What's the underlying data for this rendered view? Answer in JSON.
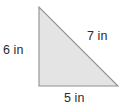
{
  "figure": {
    "type": "right-triangle",
    "shape_name": "right triangle",
    "fill_color": "#e4e4e4",
    "stroke_color": "#8f8f8f",
    "background_color": "#ffffff",
    "text_color": "#2b2b2b",
    "vertices": {
      "apex_top": [
        39,
        7
      ],
      "right_angle_bottom_left": [
        39,
        86
      ],
      "bottom_right": [
        118,
        86
      ]
    },
    "labels": {
      "left_leg": "6 in",
      "hypotenuse": "7 in",
      "bottom_leg": "5 in"
    },
    "measurements": {
      "left_leg_value": 6,
      "hypotenuse_value": 7,
      "bottom_leg_value": 5,
      "unit": "in"
    }
  }
}
